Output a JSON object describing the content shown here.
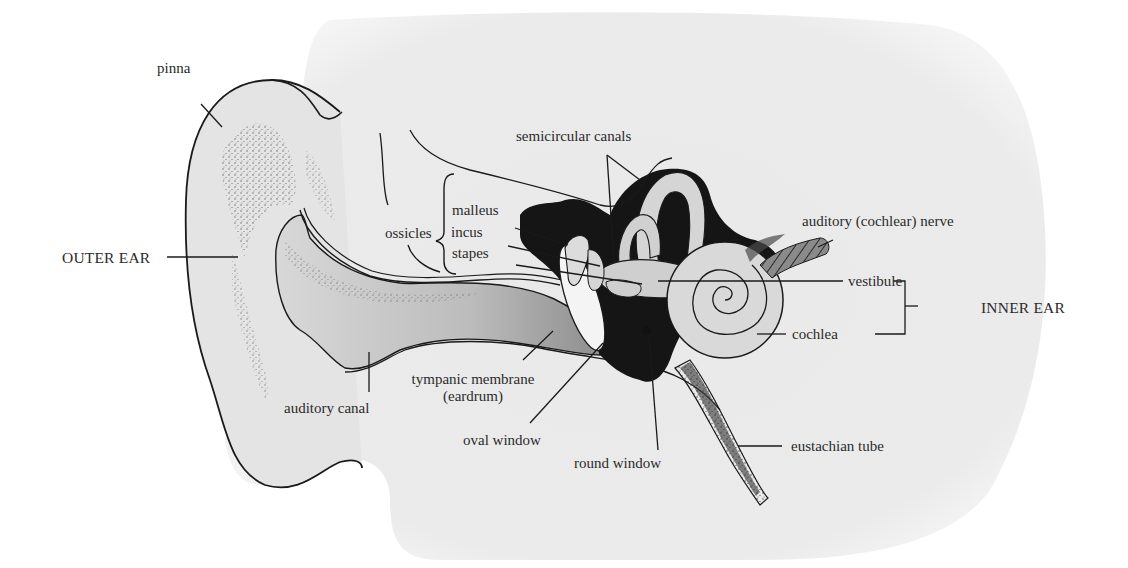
{
  "diagram": {
    "colors": {
      "background_blob": "#ececec",
      "line": "#1a1a1a",
      "dark_fill": "#141414",
      "canal_fill": "#bdbdbd",
      "nerve_fill": "#8a8a8a"
    },
    "regions": {
      "outer_ear": "OUTER EAR",
      "inner_ear": "INNER EAR"
    },
    "labels": {
      "pinna": "pinna",
      "ossicles": "ossicles",
      "malleus": "malleus",
      "incus": "incus",
      "stapes": "stapes",
      "semicircular_canals": "semicircular canals",
      "auditory_nerve": "auditory (cochlear) nerve",
      "vestibule": "vestibule",
      "cochlea": "cochlea",
      "tympanic_membrane": "tympanic membrane",
      "eardrum": "(eardrum)",
      "auditory_canal": "auditory canal",
      "oval_window": "oval window",
      "round_window": "round window",
      "eustachian_tube": "eustachian tube"
    }
  }
}
